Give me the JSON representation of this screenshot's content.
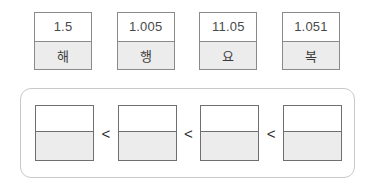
{
  "cards": [
    {
      "number": "1.5",
      "syllable": "해"
    },
    {
      "number": "1.005",
      "syllable": "행"
    },
    {
      "number": "11.05",
      "syllable": "요"
    },
    {
      "number": "1.051",
      "syllable": "복"
    }
  ],
  "answer_panel": {
    "slots": [
      {
        "id": "slot-1",
        "value": ""
      },
      {
        "id": "slot-2",
        "value": ""
      },
      {
        "id": "slot-3",
        "value": ""
      },
      {
        "id": "slot-4",
        "value": ""
      }
    ],
    "operators": [
      "<",
      "<",
      "<"
    ]
  },
  "colors": {
    "card_border": "#8a8a8a",
    "card_shade": "#ececec",
    "panel_border": "#c9c9c9",
    "slot_border": "#6f6f6f",
    "text": "#4a4a4a",
    "background": "#ffffff"
  }
}
